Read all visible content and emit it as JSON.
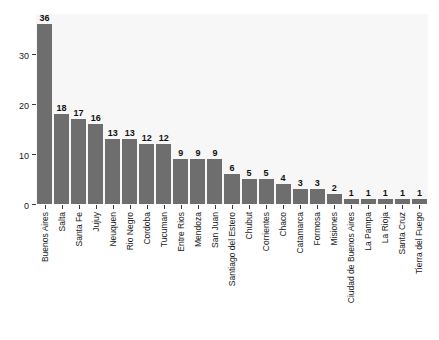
{
  "chart_data": {
    "type": "bar",
    "title": "",
    "xlabel": "",
    "ylabel": "",
    "ylim": [
      0,
      38
    ],
    "yticks": [
      0,
      10,
      20,
      30
    ],
    "ytick_labels": [
      "0",
      "10",
      "20",
      "30"
    ],
    "grid": false,
    "legend": null,
    "bar_color": "#6e6e6e",
    "panel_color": "#f7f7f7",
    "categories": [
      "Buenos Aires",
      "Salta",
      "Santa Fe",
      "Jujuy",
      "Neuquen",
      "Rio Negro",
      "Cordoba",
      "Tucuman",
      "Entre Rios",
      "Mendoza",
      "San Juan",
      "Santiago del Estero",
      "Chubut",
      "Corrientes",
      "Chaco",
      "Catamarca",
      "Formosa",
      "Misiones",
      "Ciudad de Buenos Aires",
      "La Pampa",
      "La Rioja",
      "Santa Cruz",
      "Tierra del Fuego"
    ],
    "values": [
      36,
      18,
      17,
      16,
      13,
      13,
      12,
      12,
      9,
      9,
      9,
      6,
      5,
      5,
      4,
      3,
      3,
      2,
      1,
      1,
      1,
      1,
      1
    ],
    "value_labels": [
      "36",
      "18",
      "17",
      "16",
      "13",
      "13",
      "12",
      "12",
      "9",
      "9",
      "9",
      "6",
      "5",
      "5",
      "4",
      "3",
      "3",
      "2",
      "1",
      "1",
      "1",
      "1",
      "1"
    ]
  }
}
